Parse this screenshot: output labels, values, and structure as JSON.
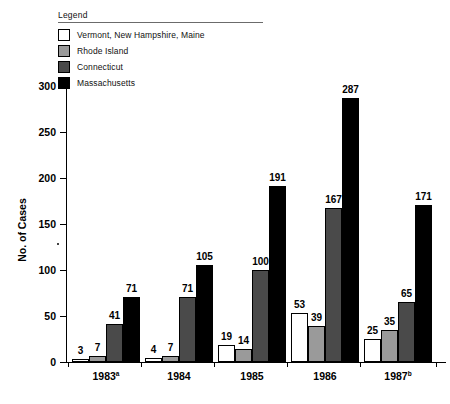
{
  "legend": {
    "title": "Legend",
    "items": [
      {
        "label": "Vermont, New Hampshire, Maine",
        "color": "#ffffff"
      },
      {
        "label": "Rhode Island",
        "color": "#9a9a9a"
      },
      {
        "label": "Connecticut",
        "color": "#4a4a4a"
      },
      {
        "label": "Massachusetts",
        "color": "#000000"
      }
    ]
  },
  "axes": {
    "ylabel": "No. of Cases",
    "yticks": [
      "0",
      "50",
      "100",
      "150",
      "200",
      "250",
      "300"
    ]
  },
  "chart_data": {
    "type": "bar",
    "title": "",
    "xlabel": "",
    "ylabel": "No. of Cases",
    "ylim": [
      0,
      300
    ],
    "ytick_values": [
      0,
      50,
      100,
      150,
      200,
      250,
      300
    ],
    "grid": false,
    "legend_position": "top-left",
    "categories": [
      "1983a",
      "1984",
      "1985",
      "1986",
      "1987b"
    ],
    "category_labels": [
      "1983",
      "1984",
      "1985",
      "1986",
      "1987"
    ],
    "category_superscripts": [
      "a",
      "",
      "",
      "",
      "b"
    ],
    "series": [
      {
        "name": "Vermont, New Hampshire, Maine",
        "color": "#ffffff",
        "values": [
          3,
          4,
          19,
          53,
          25
        ]
      },
      {
        "name": "Rhode Island",
        "color": "#9a9a9a",
        "values": [
          7,
          7,
          14,
          39,
          35
        ]
      },
      {
        "name": "Connecticut",
        "color": "#4a4a4a",
        "values": [
          41,
          71,
          100,
          167,
          65
        ]
      },
      {
        "name": "Massachusetts",
        "color": "#000000",
        "values": [
          71,
          105,
          191,
          287,
          171
        ]
      }
    ]
  }
}
